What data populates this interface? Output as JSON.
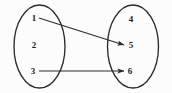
{
  "diagram": {
    "type": "function-mapping-diagram",
    "background_color": "#fcfcfc",
    "stroke_color": "#2b2b2b",
    "label_color": "#1d1d1d",
    "sets": [
      {
        "name": "domain-set",
        "side": "left",
        "cx": 39.5,
        "cy": 46.5,
        "rx": 25.5,
        "ry": 41.5,
        "elements": [
          {
            "label": "1",
            "x": 34,
            "y": 18
          },
          {
            "label": "2",
            "x": 34,
            "y": 45
          },
          {
            "label": "3",
            "x": 33,
            "y": 71
          }
        ]
      },
      {
        "name": "codomain-set",
        "side": "right",
        "cx": 133,
        "cy": 46.5,
        "rx": 25.5,
        "ry": 41.5,
        "elements": [
          {
            "label": "4",
            "x": 131,
            "y": 19
          },
          {
            "label": "5",
            "x": 131,
            "y": 45
          },
          {
            "label": "6",
            "x": 130,
            "y": 71
          }
        ]
      }
    ],
    "arrows": [
      {
        "name": "arrow-1-to-5",
        "from_label": "1",
        "to_label": "5",
        "x1": 39,
        "y1": 18,
        "x2": 124,
        "y2": 45
      },
      {
        "name": "arrow-3-to-6",
        "from_label": "3",
        "to_label": "6",
        "x1": 39,
        "y1": 71,
        "x2": 124,
        "y2": 71
      }
    ]
  }
}
